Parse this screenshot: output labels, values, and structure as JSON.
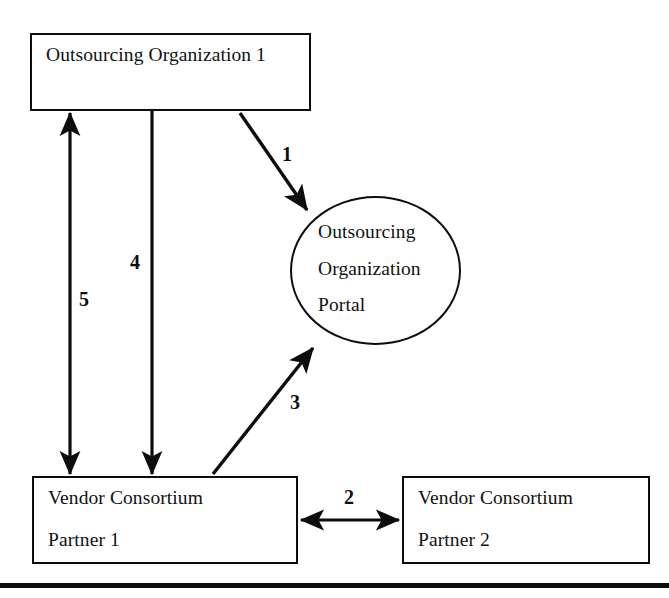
{
  "diagram": {
    "background_color": "#ffffff",
    "stroke_color": "#0d0d0d",
    "nodes": {
      "top_org": {
        "shape": "rectangle",
        "line1": "Outsourcing Organization 1"
      },
      "portal": {
        "shape": "ellipse",
        "line1": "Outsourcing",
        "line2": "Organization",
        "line3": "Portal"
      },
      "partner1": {
        "shape": "rectangle",
        "line1": "Vendor Consortium",
        "line2": "Partner 1"
      },
      "partner2": {
        "shape": "rectangle",
        "line1": "Vendor Consortium",
        "line2": "Partner 2"
      }
    },
    "edges": [
      {
        "id": "edge-1",
        "label": "1",
        "from": "top_org",
        "to": "portal",
        "direction": "one-way"
      },
      {
        "id": "edge-2",
        "label": "2",
        "from": "partner1",
        "to": "partner2",
        "direction": "two-way"
      },
      {
        "id": "edge-3",
        "label": "3",
        "from": "partner1",
        "to": "portal",
        "direction": "one-way"
      },
      {
        "id": "edge-4",
        "label": "4",
        "from": "top_org",
        "to": "partner1",
        "direction": "one-way"
      },
      {
        "id": "edge-5",
        "label": "5",
        "from": "partner1",
        "to": "top_org",
        "direction": "two-way"
      }
    ],
    "footer_rule": true
  }
}
